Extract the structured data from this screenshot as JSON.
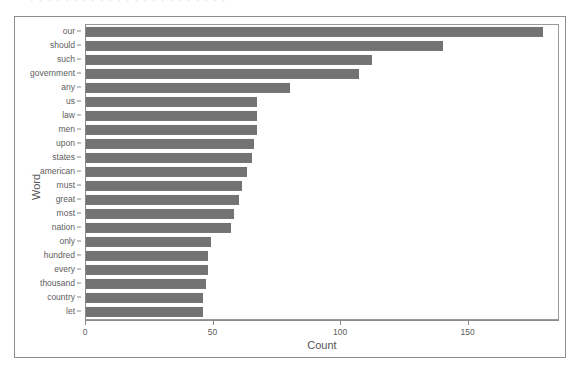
{
  "scan": {
    "top_remnant_text": "· · · · · · · · · · · · · · · · · · · · · · ·"
  },
  "colors": {
    "bar": "#737373",
    "axis": "#8a8a8a",
    "text": "#5d5d5d",
    "frame": "#8d8d8d",
    "background": "#ffffff"
  },
  "chart_data": {
    "type": "bar",
    "orientation": "horizontal",
    "title": "",
    "subtitle": "",
    "xlabel": "Count",
    "ylabel": "Word",
    "xlim": [
      0,
      185
    ],
    "ylim": null,
    "grid": false,
    "legend": null,
    "legend_position": "none",
    "xticks": [
      0,
      50,
      100,
      150
    ],
    "xticklabels": [
      "0",
      "50",
      "100",
      "150"
    ],
    "categories": [
      "our",
      "should",
      "such",
      "government",
      "any",
      "us",
      "law",
      "men",
      "upon",
      "states",
      "american",
      "must",
      "great",
      "most",
      "nation",
      "only",
      "hundred",
      "every",
      "thousand",
      "country",
      "let"
    ],
    "values": [
      179,
      140,
      112,
      107,
      80,
      67,
      67,
      67,
      66,
      65,
      63,
      61,
      60,
      58,
      57,
      49,
      48,
      48,
      47,
      46,
      46
    ]
  }
}
